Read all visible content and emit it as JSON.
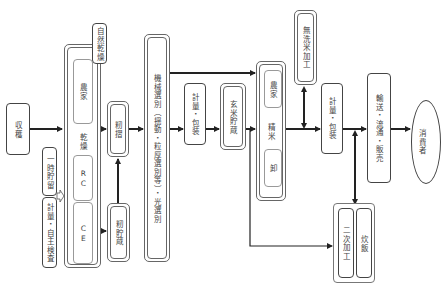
{
  "diagram": {
    "type": "rice-distribution-flow",
    "nodes": {
      "harvest": "収穫",
      "temporary_storage": "一時貯留",
      "weighing_inspection": "計量・自主検査",
      "natural_drying": "自然乾燥",
      "drying": {
        "label": "乾燥",
        "sub": [
          "農家",
          "RC",
          "CE"
        ]
      },
      "hulling": "籾摺",
      "paddy_storage": "籾貯蔵",
      "sorting": "機械選別（揺動・粒厚選別等）・光選別",
      "weighing_packing_1": "計量・包装",
      "brown_rice_storage": "玄米貯蔵",
      "polishing": {
        "label": "精米",
        "sub": [
          "農家",
          "卸"
        ]
      },
      "wash_free_processing": "無洗米加工",
      "weighing_packing_2": "計量・包装",
      "secondary": {
        "items": [
          "二次加工",
          "炊飯"
        ]
      },
      "transport": "輸送・流通・販売",
      "consumer": "消費者"
    },
    "edges": [
      [
        "収穫",
        "乾燥"
      ],
      [
        "一時貯留",
        "乾燥"
      ],
      [
        "乾燥",
        "籾摺"
      ],
      [
        "乾燥",
        "籾貯蔵"
      ],
      [
        "籾貯蔵",
        "籾摺"
      ],
      [
        "籾摺",
        "機械選別"
      ],
      [
        "機械選別",
        "計量・包装"
      ],
      [
        "機械選別",
        "精米"
      ],
      [
        "計量・包装",
        "玄米貯蔵"
      ],
      [
        "玄米貯蔵",
        "精米"
      ],
      [
        "玄米貯蔵",
        "二次加工"
      ],
      [
        "精米",
        "計量・包装(2)"
      ],
      [
        "精米",
        "無洗米加工"
      ],
      [
        "無洗米加工",
        "精米"
      ],
      [
        "計量・包装(2)",
        "輸送・流通・販売"
      ],
      [
        "二次加工",
        "輸送・流通・販売"
      ],
      [
        "輸送・流通・販売",
        "消費者"
      ]
    ],
    "colors": {
      "line": "#222222",
      "border": "#555555",
      "background": "#ffffff"
    }
  }
}
